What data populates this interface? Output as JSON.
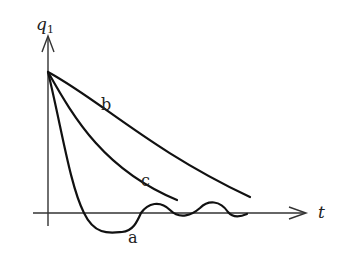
{
  "diagram": {
    "type": "response-curves",
    "axes": {
      "y_label": "q",
      "y_label_subscript": "1",
      "x_label": "t"
    },
    "curves": [
      {
        "label": "a",
        "description": "underdamped oscillation decaying about zero"
      },
      {
        "label": "b",
        "description": "slow overdamped decay"
      },
      {
        "label": "c",
        "description": "faster critically damped decay"
      }
    ]
  }
}
